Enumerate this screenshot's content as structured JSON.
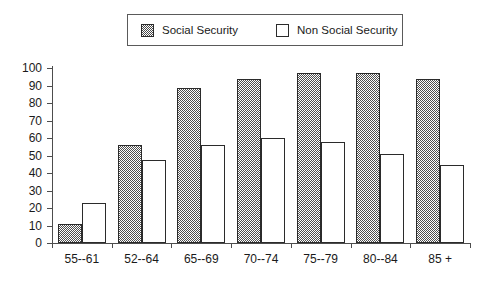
{
  "legend": {
    "position": "top-center",
    "entries": [
      {
        "label": "Social Security",
        "swatch": "hatched-swatch-icon"
      },
      {
        "label": "Non Social Security",
        "swatch": "hollow-swatch-icon"
      }
    ]
  },
  "chart_data": {
    "type": "bar",
    "title": "",
    "subtitle": "",
    "xlabel": "",
    "ylabel": "",
    "categories": [
      "55--61",
      "52--64",
      "65--69",
      "70--74",
      "75--79",
      "80--84",
      "85 +"
    ],
    "series": [
      {
        "name": "Social Security",
        "values": [
          11,
          56,
          88.5,
          94,
          97,
          97,
          93.5
        ]
      },
      {
        "name": "Non Social Security",
        "values": [
          23,
          47.5,
          56,
          60,
          58,
          51,
          44.5
        ]
      }
    ],
    "ylim": [
      0,
      100
    ],
    "ytick_step": 10,
    "yticks": [
      0,
      10,
      20,
      30,
      40,
      50,
      60,
      70,
      80,
      90,
      100
    ],
    "ytick_labels": [
      "0",
      "10",
      "20",
      "30",
      "40",
      "50",
      "60",
      "70",
      "80",
      "90",
      "100"
    ],
    "grid": false,
    "legend_position": "top-center",
    "colors": {
      "social_security_fill": "#4f4f4f",
      "non_social_security_fill": "#ffffff",
      "outline": "#2b2b2b",
      "axis": "#4d4d4d",
      "text": "#1a1a1a",
      "background": "#ffffff"
    }
  }
}
